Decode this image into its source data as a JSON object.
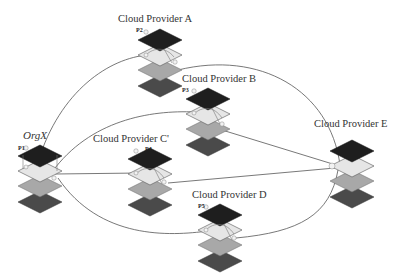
{
  "diagram": {
    "type": "network-of-layered-stacks",
    "nodes": [
      {
        "id": "orgx",
        "label": "OrgX",
        "peer": "P1",
        "italic": true,
        "cx": 40,
        "top": 145
      },
      {
        "id": "a",
        "label": "Cloud Provider A",
        "peer": "P2",
        "cx": 160,
        "top": 40
      },
      {
        "id": "b",
        "label": "Cloud Provider B",
        "peer": "P3",
        "cx": 208,
        "top": 98
      },
      {
        "id": "c",
        "label": "Cloud Provider C'",
        "peer": "P4",
        "cx": 150,
        "top": 157
      },
      {
        "id": "d",
        "label": "Cloud Provider D",
        "peer": "P5",
        "cx": 220,
        "top": 215
      },
      {
        "id": "e",
        "label": "Cloud Provider E",
        "peer": "",
        "cx": 352,
        "top": 150
      }
    ],
    "edges": [
      {
        "from": "orgx",
        "to": "a"
      },
      {
        "from": "orgx",
        "to": "b"
      },
      {
        "from": "orgx",
        "to": "c"
      },
      {
        "from": "orgx",
        "to": "d"
      },
      {
        "from": "a",
        "to": "e"
      },
      {
        "from": "b",
        "to": "e"
      },
      {
        "from": "c",
        "to": "e"
      },
      {
        "from": "d",
        "to": "e"
      }
    ],
    "layers_per_stack": 4,
    "colors": {
      "layer1": "#1e1e1e",
      "layer2": "#e6e6e6",
      "layer3": "#a8a8a8",
      "layer4": "#4a4a4a",
      "edge": "#555555"
    }
  },
  "labels": {
    "orgx": "OrgX",
    "a": "Cloud Provider A",
    "b": "Cloud Provider B",
    "c": "Cloud Provider C'",
    "d": "Cloud Provider D",
    "e": "Cloud Provider E",
    "p1": "P1",
    "p2": "P2",
    "p3": "P3",
    "p4": "P4",
    "p5": "P5"
  }
}
